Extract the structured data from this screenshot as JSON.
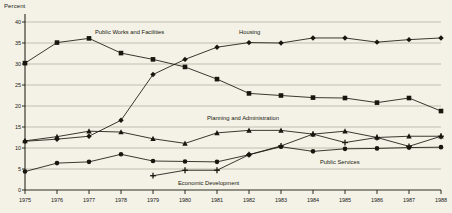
{
  "chart_data": {
    "type": "line",
    "title": "",
    "xlabel": "",
    "ylabel": "Percent",
    "ylim": [
      0,
      40
    ],
    "ytick_step": 5,
    "yticks": [
      "0",
      "5",
      "10",
      "15",
      "20",
      "25",
      "30",
      "35",
      "40"
    ],
    "grid": true,
    "legend_position": "inline-annotations",
    "x": [
      "1975",
      "1976",
      "1977",
      "1978",
      "1979",
      "1980",
      "1981",
      "1982",
      "1983",
      "1984",
      "1985",
      "1986",
      "1987",
      "1988"
    ],
    "series": [
      {
        "name": "Public Works and Facilities",
        "marker": "square",
        "values": [
          30.2,
          35.1,
          36.1,
          32.6,
          31.1,
          29.3,
          26.4,
          23.0,
          22.5,
          22.0,
          21.9,
          20.8,
          21.9,
          18.8
        ]
      },
      {
        "name": "Housing",
        "marker": "diamond",
        "values": [
          11.6,
          12.1,
          12.8,
          16.6,
          27.5,
          31.1,
          34.0,
          35.1,
          35.0,
          36.2,
          36.2,
          35.2,
          35.8,
          36.2
        ]
      },
      {
        "name": "Planning and Administration",
        "marker": "triangle",
        "values": [
          11.7,
          12.7,
          14.0,
          13.8,
          12.2,
          11.1,
          13.6,
          14.2,
          14.2,
          13.3,
          14.0,
          12.5,
          12.8,
          12.8
        ]
      },
      {
        "name": "Public Services",
        "marker": "circle",
        "values": [
          4.4,
          6.4,
          6.7,
          8.5,
          6.9,
          6.8,
          6.7,
          8.4,
          10.3,
          9.2,
          9.8,
          9.9,
          10.1,
          10.2
        ]
      },
      {
        "name": "Economic Development",
        "marker": "plus",
        "values": [
          null,
          null,
          null,
          null,
          3.4,
          4.7,
          4.7,
          8.4,
          10.5,
          13.3,
          11.3,
          12.5,
          10.4,
          12.8
        ]
      }
    ],
    "annotations": [
      {
        "text": "Public Works and Facilities",
        "x_px": 95,
        "y_px": 29
      },
      {
        "text": "Housing",
        "x_px": 239,
        "y_px": 29
      },
      {
        "text": "Planning and Administration",
        "x_px": 207,
        "y_px": 115
      },
      {
        "text": "Public Services",
        "x_px": 320,
        "y_px": 159
      },
      {
        "text": "Economic Development",
        "x_px": 178,
        "y_px": 180
      }
    ],
    "colors": {
      "background": "#f4f2e6",
      "line": "#17170f",
      "grid": "#9a9a8c",
      "axis": "#17170f",
      "text": "#17170f"
    }
  }
}
